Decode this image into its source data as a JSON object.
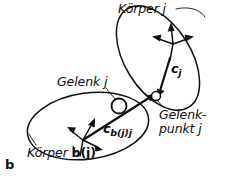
{
  "figure": {
    "part_label": "b",
    "caption_language": "de",
    "type": "multibody-joint-diagram"
  },
  "labels": {
    "body_j": "Körper j",
    "joint_j": "Gelenk j",
    "joint_point_j_line1": "Gelenk-",
    "joint_point_j_line2": "punkt j",
    "body_bj_prefix": "Körper ",
    "body_bj_suffix": "b(j)",
    "vector_cj_name": "c",
    "vector_cj_sub": "j",
    "vector_cbjj_name": "c",
    "vector_cbjj_sub": "b(j)j"
  },
  "icons": {
    "joint_marker": "open-circle-icon",
    "joint_point_marker": "small-open-circle-icon",
    "frame_arrow": "arrow-head-icon",
    "vector_arrow": "vector-arrow-icon"
  },
  "colors": {
    "stroke": "#101010",
    "background": "#ffffff",
    "marker_fill": "#ffffff"
  },
  "geometry": {
    "body_j_ellipse": {
      "cx": 158,
      "cy": 58,
      "rx": 33,
      "ry": 58,
      "rotation_deg": -32
    },
    "body_bj_ellipse": {
      "cx": 88,
      "cy": 126,
      "rx": 61,
      "ry": 33,
      "rotation_deg": -8
    },
    "joint_center": {
      "x": 119,
      "y": 106
    },
    "joint_point": {
      "x": 156,
      "y": 97
    },
    "frame_j_origin": {
      "x": 173,
      "y": 44
    },
    "frame_bj_origin": {
      "x": 83,
      "y": 140
    }
  }
}
